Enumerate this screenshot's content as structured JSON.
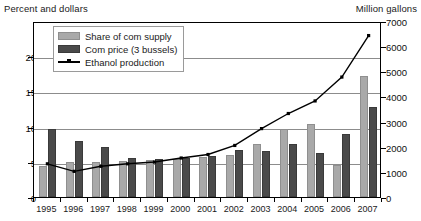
{
  "chart_data": {
    "type": "bar",
    "title": "",
    "subtitle": "",
    "xlabel": "",
    "ylabel": "Percent and dollars",
    "y2label": "Million gallons",
    "categories": [
      "1995",
      "1996",
      "1997",
      "1998",
      "1999",
      "2000",
      "2001",
      "2002",
      "2003",
      "2004",
      "2005",
      "2006",
      "2007"
    ],
    "ylim": [
      0,
      25
    ],
    "y2lim": [
      0,
      7000
    ],
    "yticks": [
      "0",
      "5",
      "10",
      "15",
      "20"
    ],
    "ytick_values": [
      0,
      5,
      10,
      15,
      20
    ],
    "y2ticks": [
      "0",
      "1000",
      "2000",
      "3000",
      "4000",
      "5000",
      "6000",
      "7000"
    ],
    "y2tick_values": [
      0,
      1000,
      2000,
      3000,
      4000,
      5000,
      6000,
      7000
    ],
    "grid": true,
    "legend_position": "upper-left",
    "series": [
      {
        "name": "Share of com supply",
        "type": "bar",
        "axis": "left",
        "color": "#a9a9a9",
        "values": [
          4.4,
          5.0,
          5.0,
          5.1,
          5.2,
          5.4,
          5.7,
          6.0,
          7.5,
          9.6,
          10.4,
          4.6,
          17.2
        ]
      },
      {
        "name": "Com price (3 bussels)",
        "type": "bar",
        "axis": "left",
        "color": "#4a4a4a",
        "values": [
          9.6,
          8.0,
          7.1,
          5.5,
          5.4,
          5.5,
          5.8,
          6.7,
          6.6,
          7.5,
          6.2,
          9.0,
          12.8
        ]
      },
      {
        "name": "Ethanol production",
        "type": "line",
        "axis": "right",
        "color": "#000000",
        "marker": "square",
        "values": [
          1400,
          1100,
          1300,
          1400,
          1470,
          1630,
          1770,
          2130,
          2800,
          3400,
          3900,
          4850,
          6500
        ]
      }
    ]
  },
  "legend": {
    "items": [
      {
        "label": "Share of com supply",
        "swatch": "share-swatch"
      },
      {
        "label": "Com price (3 bussels)",
        "swatch": "price-swatch"
      },
      {
        "label": "Ethanol production",
        "swatch": "line-swatch"
      }
    ]
  },
  "axes": {
    "left_title": "Percent and dollars",
    "right_title": "Million gallons"
  }
}
